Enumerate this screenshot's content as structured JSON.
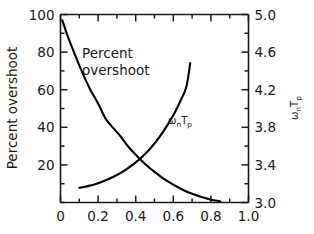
{
  "chart_data": {
    "type": "line",
    "title": "",
    "xlabel": "",
    "ylabel": "Percent overshoot",
    "y2label": "ωₙTₚ",
    "xlim": [
      0,
      1.0
    ],
    "ylim": [
      0,
      100
    ],
    "y2lim": [
      3.0,
      5.0
    ],
    "grid": false,
    "legend": "in-plot annotations",
    "x_ticks": [
      "0",
      "0.2",
      "0.4",
      "0.6",
      "0.8",
      "1.0"
    ],
    "x_tick_values": [
      0,
      0.2,
      0.4,
      0.6,
      0.8,
      1.0
    ],
    "x_minor_step": 0.1,
    "y_ticks": [
      "20",
      "40",
      "60",
      "80",
      "100"
    ],
    "y_tick_values": [
      20,
      40,
      60,
      80,
      100
    ],
    "y_minor_step": 10,
    "y2_ticks": [
      "3.0",
      "3.4",
      "3.8",
      "4.2",
      "4.6",
      "5.0"
    ],
    "y2_tick_values": [
      3.0,
      3.4,
      3.8,
      4.2,
      4.6,
      5.0
    ],
    "y2_minor_step": 0.2,
    "annotations": [
      {
        "text": "Percent overshoot",
        "x": 0.16,
        "y": 72
      },
      {
        "text": "ωₙTₚ",
        "x": 0.56,
        "y": 44
      }
    ],
    "series": [
      {
        "name": "Percent overshoot",
        "axis": "left",
        "x": [
          0.01,
          0.03,
          0.05,
          0.08,
          0.1,
          0.13,
          0.16,
          0.2,
          0.24,
          0.28,
          0.32,
          0.36,
          0.4,
          0.45,
          0.5,
          0.55,
          0.6,
          0.65,
          0.7,
          0.75,
          0.8,
          0.85
        ],
        "values": [
          96.9,
          90.8,
          85.4,
          77.8,
          72.9,
          66.0,
          59.7,
          52.7,
          44.6,
          39.7,
          35.1,
          29.8,
          25.4,
          20.5,
          16.3,
          12.6,
          9.5,
          6.8,
          4.6,
          2.9,
          1.5,
          0.6
        ]
      },
      {
        "name": "ωₙTₚ",
        "axis": "right",
        "x": [
          0.1,
          0.15,
          0.2,
          0.25,
          0.3,
          0.35,
          0.4,
          0.45,
          0.5,
          0.55,
          0.6,
          0.64,
          0.67,
          0.69
        ],
        "values": [
          3.157,
          3.177,
          3.206,
          3.245,
          3.293,
          3.353,
          3.427,
          3.517,
          3.628,
          3.765,
          3.927,
          4.09,
          4.235,
          4.484
        ]
      }
    ]
  },
  "axes": {
    "left_title": "Percent overshoot",
    "right_title": "ωₙTₚ",
    "omega_base": "ω",
    "omega_sub": "n",
    "t_base": "T",
    "t_sub": "p"
  },
  "annotations": {
    "overshoot_line1": "Percent",
    "overshoot_line2": "overshoot"
  },
  "colors": {
    "curve": "#000000",
    "axis": "#1a1a1a",
    "background": "#ffffff"
  }
}
